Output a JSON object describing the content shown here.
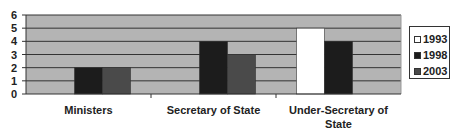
{
  "chart_data": {
    "type": "bar",
    "title": "",
    "xlabel": "",
    "ylabel": "",
    "ylim": [
      0,
      6
    ],
    "yticks": [
      0,
      1,
      2,
      3,
      4,
      5,
      6
    ],
    "grid": true,
    "legend_position": "right",
    "categories": [
      "Ministers",
      "Secretary of State",
      "Under-Secretary of State"
    ],
    "category_label_lines": [
      [
        "Ministers"
      ],
      [
        "Secretary of State"
      ],
      [
        "Under-Secretary of",
        "State"
      ]
    ],
    "series": [
      {
        "name": "1993",
        "values": [
          0,
          0,
          5
        ],
        "color": "#ffffff"
      },
      {
        "name": "1998",
        "values": [
          2,
          4,
          4
        ],
        "color": "#1c1c1c"
      },
      {
        "name": "2003",
        "values": [
          2,
          3,
          0
        ],
        "color": "#4a4a4a"
      }
    ],
    "plot_background": "#b4b4b4",
    "gridline_color": "#333333"
  },
  "legend": {
    "items": [
      {
        "label": "1993",
        "color": "#ffffff"
      },
      {
        "label": "1998",
        "color": "#1c1c1c"
      },
      {
        "label": "2003",
        "color": "#4a4a4a"
      }
    ]
  }
}
